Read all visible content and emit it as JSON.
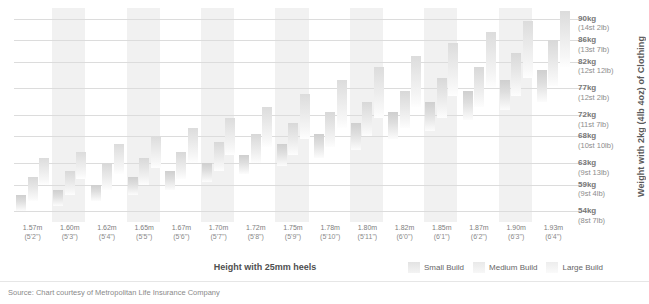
{
  "chart_data": {
    "type": "bar",
    "title": "",
    "subtitle": "",
    "xlabel": "Height with 25mm heels",
    "ylabel": "Weight with 2kg (4lb 4oz) of Clothing",
    "grid": true,
    "legend_position": "bottom-right",
    "note": "Floating range bars: each build category shows a min-max ideal weight band for a given height.",
    "y_ticks": [
      {
        "kg": "90kg",
        "imperial": "(14st 2lb)",
        "value": 90
      },
      {
        "kg": "86kg",
        "imperial": "(13st 7lb)",
        "value": 86
      },
      {
        "kg": "82kg",
        "imperial": "(12st 12lb)",
        "value": 82
      },
      {
        "kg": "77kg",
        "imperial": "(12st 2lb)",
        "value": 77
      },
      {
        "kg": "72kg",
        "imperial": "(11st 7lb)",
        "value": 72
      },
      {
        "kg": "68kg",
        "imperial": "(10st 10lb)",
        "value": 68
      },
      {
        "kg": "63kg",
        "imperial": "(9st 13lb)",
        "value": 63
      },
      {
        "kg": "59kg",
        "imperial": "(9st 4lb)",
        "value": 59
      },
      {
        "kg": "54kg",
        "imperial": "(8st 7lb)",
        "value": 54
      }
    ],
    "ylim": [
      52,
      92
    ],
    "categories": [
      {
        "metric": "1.57m",
        "imperial": "(5'2\")"
      },
      {
        "metric": "1.60m",
        "imperial": "(5'3\")"
      },
      {
        "metric": "1.62m",
        "imperial": "(5'4\")"
      },
      {
        "metric": "1.65m",
        "imperial": "(5'5\")"
      },
      {
        "metric": "1.67m",
        "imperial": "(5'6\")"
      },
      {
        "metric": "1.70m",
        "imperial": "(5'7\")"
      },
      {
        "metric": "1.72m",
        "imperial": "(5'8\")"
      },
      {
        "metric": "1.75m",
        "imperial": "(5'9\")"
      },
      {
        "metric": "1.78m",
        "imperial": "(5'10\")"
      },
      {
        "metric": "1.80m",
        "imperial": "(5'11\")"
      },
      {
        "metric": "1.82m",
        "imperial": "(6'0\")"
      },
      {
        "metric": "1.85m",
        "imperial": "(6'1\")"
      },
      {
        "metric": "1.87m",
        "imperial": "(6'2\")"
      },
      {
        "metric": "1.90m",
        "imperial": "(6'3\")"
      },
      {
        "metric": "1.93m",
        "imperial": "(6'4\")"
      }
    ],
    "series": [
      {
        "name": "Small Build",
        "ranges": [
          [
            54.0,
            57.0
          ],
          [
            55.0,
            58.0
          ],
          [
            56.0,
            59.0
          ],
          [
            57.0,
            60.5
          ],
          [
            58.0,
            61.5
          ],
          [
            59.5,
            63.0
          ],
          [
            61.0,
            64.5
          ],
          [
            62.5,
            66.5
          ],
          [
            64.0,
            68.5
          ],
          [
            65.5,
            70.5
          ],
          [
            67.5,
            72.5
          ],
          [
            69.0,
            74.5
          ],
          [
            71.0,
            76.5
          ],
          [
            73.0,
            78.5
          ],
          [
            74.5,
            80.5
          ]
        ]
      },
      {
        "name": "Medium Build",
        "ranges": [
          [
            56.0,
            60.5
          ],
          [
            57.0,
            61.5
          ],
          [
            58.0,
            63.0
          ],
          [
            59.0,
            64.0
          ],
          [
            60.0,
            65.0
          ],
          [
            61.5,
            67.0
          ],
          [
            63.0,
            68.5
          ],
          [
            64.5,
            70.5
          ],
          [
            66.0,
            72.5
          ],
          [
            68.0,
            74.5
          ],
          [
            69.5,
            76.5
          ],
          [
            71.5,
            79.0
          ],
          [
            73.5,
            81.0
          ],
          [
            75.5,
            83.5
          ],
          [
            77.5,
            86.0
          ]
        ]
      },
      {
        "name": "Large Build",
        "ranges": [
          [
            59.0,
            64.0
          ],
          [
            60.0,
            65.0
          ],
          [
            61.0,
            66.5
          ],
          [
            62.0,
            68.0
          ],
          [
            63.0,
            69.5
          ],
          [
            64.5,
            71.5
          ],
          [
            66.0,
            73.5
          ],
          [
            67.5,
            76.0
          ],
          [
            69.5,
            78.5
          ],
          [
            71.5,
            81.0
          ],
          [
            73.5,
            83.0
          ],
          [
            75.5,
            85.5
          ],
          [
            77.0,
            87.5
          ],
          [
            79.0,
            89.5
          ],
          [
            81.0,
            91.5
          ]
        ]
      }
    ]
  },
  "legend": [
    {
      "label": "Small Build"
    },
    {
      "label": "Medium Build"
    },
    {
      "label": "Large Build"
    }
  ],
  "axis": {
    "x_title": "Height with 25mm heels",
    "y_title": "Weight with 2kg (4lb 4oz) of Clothing"
  },
  "footer": {
    "source": "Source: Chart courtesy of Metropolitan Life Insurance Company"
  },
  "colors": {
    "band": "#f1f1f1",
    "grid": "#dcdcdc",
    "bar_top": "#d3d3d3",
    "bar_bottom": "#fdfdfd",
    "text": "#6e6e6e"
  }
}
